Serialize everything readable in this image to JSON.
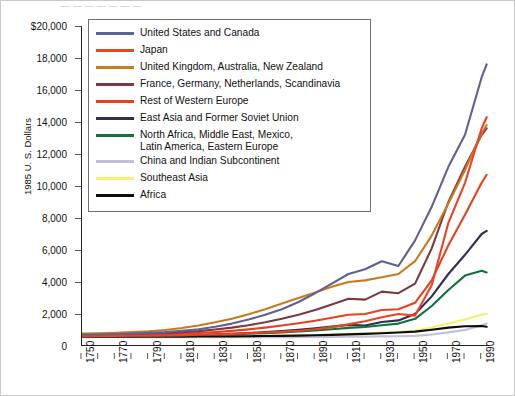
{
  "top_cropped_text": "— — —   —   —  —   —",
  "axes": {
    "ylabel": "1985 U. S. Dollars",
    "yticks": [
      "$20,000",
      "18,000",
      "16,000",
      "14,000",
      "12,000",
      "10,000",
      "8,000",
      "6,000",
      "4,000",
      "2,000",
      "0"
    ],
    "xticks": [
      "1750",
      "1770",
      "1790",
      "1810",
      "1830",
      "1850",
      "1870",
      "1890",
      "1910",
      "1930",
      "1950",
      "1970",
      "1990"
    ]
  },
  "legend": {
    "items": [
      {
        "label": "United States and Canada",
        "color": "#5f6096"
      },
      {
        "label": "Japan",
        "color": "#ef4123"
      },
      {
        "label": "United Kingdom, Australia, New Zealand",
        "color": "#c87a1e"
      },
      {
        "label": "France, Germany, Netherlands, Scandinavia",
        "color": "#7b3a42"
      },
      {
        "label": "Rest of Western Europe",
        "color": "#e8411f"
      },
      {
        "label": "East Asia and Former Soviet Union",
        "color": "#2e2f52"
      },
      {
        "label": "North Africa, Middle East, Mexico,\nLatin America, Eastern Europe",
        "color": "#10733a"
      },
      {
        "label": "China and Indian Subcontinent",
        "color": "#c3bfda"
      },
      {
        "label": "Southeast Asia",
        "color": "#f7f06a"
      },
      {
        "label": "Africa",
        "color": "#0d0d0d"
      }
    ]
  },
  "chart_data": {
    "type": "line",
    "title": "",
    "xlabel": "",
    "ylabel": "1985 U. S. Dollars",
    "xlim": [
      1750,
      1995
    ],
    "ylim": [
      0,
      20000
    ],
    "grid": false,
    "legend_position": "upper-left-inside",
    "x": [
      1750,
      1760,
      1770,
      1780,
      1790,
      1800,
      1810,
      1820,
      1830,
      1840,
      1850,
      1860,
      1870,
      1880,
      1890,
      1900,
      1910,
      1920,
      1930,
      1940,
      1950,
      1960,
      1970,
      1980,
      1990,
      1993
    ],
    "series": [
      {
        "name": "United States and Canada",
        "color": "#5f6096",
        "values": [
          700,
          720,
          750,
          780,
          820,
          870,
          950,
          1050,
          1200,
          1400,
          1650,
          1950,
          2300,
          2750,
          3300,
          3900,
          4500,
          4800,
          5300,
          5000,
          6600,
          8700,
          11200,
          13200,
          16800,
          17600
        ]
      },
      {
        "name": "Japan",
        "color": "#ef4123",
        "values": [
          620,
          625,
          630,
          640,
          650,
          660,
          680,
          700,
          730,
          760,
          800,
          840,
          880,
          950,
          1050,
          1180,
          1350,
          1550,
          1800,
          2000,
          1900,
          3800,
          7700,
          10200,
          13600,
          14300
        ]
      },
      {
        "name": "United Kingdom, Australia, New Zealand",
        "color": "#c87a1e",
        "values": [
          780,
          800,
          830,
          870,
          920,
          1000,
          1120,
          1280,
          1480,
          1700,
          1980,
          2300,
          2650,
          3000,
          3350,
          3700,
          4000,
          4100,
          4300,
          4500,
          5300,
          6900,
          8900,
          11000,
          13300,
          13800
        ]
      },
      {
        "name": "France, Germany, Netherlands, Scandinavia",
        "color": "#7b3a42",
        "values": [
          700,
          710,
          725,
          745,
          770,
          805,
          860,
          930,
          1030,
          1150,
          1300,
          1480,
          1700,
          1950,
          2250,
          2600,
          2950,
          2900,
          3400,
          3300,
          3900,
          6100,
          9000,
          11200,
          13200,
          13600
        ]
      },
      {
        "name": "Rest of Western Europe",
        "color": "#e8411f",
        "values": [
          650,
          660,
          670,
          685,
          705,
          730,
          765,
          810,
          870,
          945,
          1040,
          1150,
          1280,
          1420,
          1580,
          1760,
          1950,
          2000,
          2250,
          2300,
          2700,
          4100,
          6300,
          8200,
          10200,
          10700
        ]
      },
      {
        "name": "East Asia and Former Soviet Union",
        "color": "#2e2f52",
        "values": [
          600,
          605,
          612,
          620,
          630,
          645,
          665,
          690,
          720,
          760,
          810,
          870,
          940,
          1020,
          1110,
          1210,
          1320,
          1280,
          1500,
          1600,
          2000,
          3100,
          4500,
          5700,
          7000,
          7200
        ]
      },
      {
        "name": "North Africa, Middle East, Mexico, Latin America, Eastern Europe",
        "color": "#10733a",
        "values": [
          620,
          622,
          626,
          632,
          640,
          650,
          665,
          683,
          705,
          732,
          765,
          805,
          850,
          905,
          970,
          1045,
          1130,
          1190,
          1300,
          1400,
          1700,
          2500,
          3500,
          4400,
          4700,
          4600
        ]
      },
      {
        "name": "China and Indian Subcontinent",
        "color": "#c3bfda",
        "values": [
          560,
          560,
          560,
          558,
          556,
          554,
          552,
          550,
          548,
          546,
          545,
          545,
          548,
          552,
          558,
          565,
          575,
          585,
          600,
          610,
          630,
          720,
          850,
          1000,
          1300,
          1400
        ]
      },
      {
        "name": "Southeast Asia",
        "color": "#f7f06a",
        "values": [
          560,
          562,
          564,
          567,
          570,
          575,
          580,
          588,
          596,
          606,
          618,
          632,
          648,
          668,
          692,
          720,
          755,
          790,
          840,
          880,
          950,
          1150,
          1400,
          1650,
          1950,
          2000
        ]
      },
      {
        "name": "Africa",
        "color": "#0d0d0d",
        "values": [
          580,
          580,
          581,
          582,
          584,
          586,
          589,
          593,
          598,
          604,
          612,
          622,
          634,
          650,
          670,
          695,
          725,
          755,
          800,
          840,
          900,
          1020,
          1150,
          1230,
          1250,
          1200
        ]
      }
    ]
  }
}
